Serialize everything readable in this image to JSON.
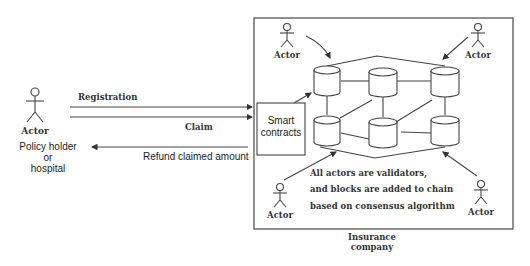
{
  "diagram": {
    "left_actor": {
      "label": "Actor",
      "role_line1": "Policy holder",
      "role_line2": "or",
      "role_line3": "hospital"
    },
    "arrows": {
      "registration": "Registration",
      "claim": "Claim",
      "refund": "Refund claimed amount"
    },
    "smart_contracts": {
      "line1": "Smart",
      "line2": "contracts"
    },
    "network_actors": [
      {
        "label": "Actor",
        "position": "top-left"
      },
      {
        "label": "Actor",
        "position": "top-right"
      },
      {
        "label": "Actor",
        "position": "bottom-left"
      },
      {
        "label": "Actor",
        "position": "bottom-right"
      }
    ],
    "note": {
      "line1": "All  actors are validators,",
      "line2": "and blocks are added to chain",
      "line3": "based on consensus algorithm"
    },
    "container_label": {
      "line1": "Insurance",
      "line2": "company"
    },
    "nodes_count": 6
  }
}
